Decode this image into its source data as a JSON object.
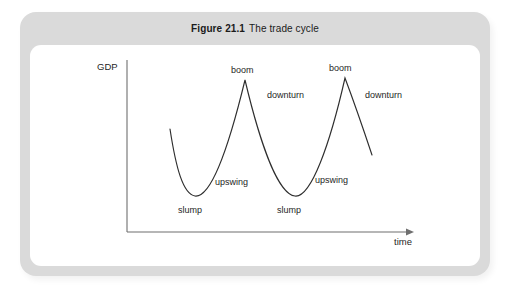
{
  "figure": {
    "caption_number": "Figure 21.1",
    "caption_text": "The trade cycle",
    "frame_color": "#dadada",
    "panel_color": "#ffffff",
    "curve_color": "#2e2e2e",
    "axis_color": "#6f6f6f"
  },
  "axes": {
    "y_label": "GDP",
    "x_label": "time"
  },
  "annotations": {
    "slump_1": "slump",
    "upswing_1": "upswing",
    "boom_1": "boom",
    "downturn_1": "downturn",
    "slump_2": "slump",
    "upswing_2": "upswing",
    "boom_2": "boom",
    "downturn_2": "downturn"
  },
  "chart_data": {
    "type": "line",
    "title": "Figure 21.1 The trade cycle",
    "xlabel": "time",
    "ylabel": "GDP",
    "grid": false,
    "legend": "none",
    "axis_origin_px": [
      127,
      232
    ],
    "x_axis_end_px": [
      412,
      232
    ],
    "y_axis_top_px": [
      127,
      60
    ],
    "series": [
      {
        "name": "GDP trade cycle",
        "points_px": [
          [
            170,
            129
          ],
          [
            195,
            196
          ],
          [
            245,
            80
          ],
          [
            295,
            196
          ],
          [
            345,
            78
          ],
          [
            372,
            155
          ]
        ],
        "path": "M170,129 C176,168 183,194 195,196 C211,198 228,150 245,80 C260,143 278,194 295,196 C311,198 330,144 345,78 C357,110 366,137 372,155",
        "feature_labels": [
          {
            "label": "slump",
            "x_px": 193,
            "y_px": 211
          },
          {
            "label": "upswing",
            "x_px": 216,
            "y_px": 182
          },
          {
            "label": "boom",
            "x_px": 231,
            "y_px": 68
          },
          {
            "label": "downturn",
            "x_px": 268,
            "y_px": 94
          },
          {
            "label": "slump",
            "x_px": 291,
            "y_px": 211
          },
          {
            "label": "upswing",
            "x_px": 316,
            "y_px": 180
          },
          {
            "label": "boom",
            "x_px": 329,
            "y_px": 66
          },
          {
            "label": "downturn",
            "x_px": 366,
            "y_px": 94
          }
        ]
      }
    ]
  }
}
